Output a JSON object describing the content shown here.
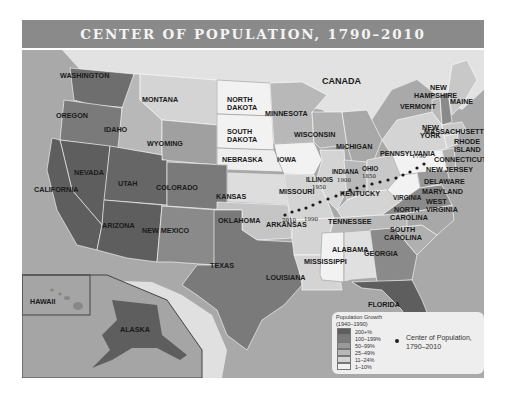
{
  "title": "CENTER OF POPULATION, 1790–2010",
  "labels": {
    "canada": "CANADA",
    "washington": "WASHINGTON",
    "oregon": "OREGON",
    "idaho": "IDAHO",
    "montana": "MONTANA",
    "wyoming": "WYOMING",
    "north_dakota_1": "NORTH",
    "north_dakota_2": "DAKOTA",
    "south_dakota_1": "SOUTH",
    "south_dakota_2": "DAKOTA",
    "minnesota": "MINNESOTA",
    "wisconsin": "WISCONSIN",
    "michigan": "MICHIGAN",
    "iowa": "IOWA",
    "nebraska": "NEBRASKA",
    "nevada": "NEVADA",
    "utah": "UTAH",
    "california": "CALIFORNIA",
    "colorado": "COLORADO",
    "kansas": "KANSAS",
    "missouri": "MISSOURI",
    "illinois": "ILLINOIS",
    "indiana": "INDIANA",
    "ohio": "OHIO",
    "pennsylvania": "PENNSYLVANIA",
    "new_york_1": "NEW",
    "new_york_2": "YORK",
    "vermont": "VERMONT",
    "new_hampshire_1": "NEW",
    "new_hampshire_2": "HAMPSHIRE",
    "maine": "MAINE",
    "massachusetts": "MASSACHUSETTS",
    "rhode_island_1": "RHODE",
    "rhode_island_2": "ISLAND",
    "connecticut": "CONNECTICUT",
    "new_jersey": "NEW JERSEY",
    "delaware": "DELAWARE",
    "maryland": "MARYLAND",
    "west_virginia_1": "WEST",
    "west_virginia_2": "VIRGINIA",
    "virginia": "VIRGINIA",
    "kentucky": "KENTUCKY",
    "tennessee": "TENNESSEE",
    "north_carolina_1": "NORTH",
    "north_carolina_2": "CAROLINA",
    "south_carolina_1": "SOUTH",
    "south_carolina_2": "CAROLINA",
    "georgia": "GEORGIA",
    "alabama": "ALABAMA",
    "mississippi": "MISSISSIPPI",
    "louisiana": "LOUISIANA",
    "arkansas": "ARKANSAS",
    "oklahoma": "OKLAHOMA",
    "texas": "TEXAS",
    "new_mexico": "NEW MEXICO",
    "arizona": "ARIZONA",
    "florida": "FLORIDA",
    "hawaii": "HAWAII",
    "alaska": "ALASKA"
  },
  "years": {
    "y1790": "1790",
    "y1850": "1850",
    "y1900": "1900",
    "y1950": "1950",
    "y1990": "1990",
    "y2010": "2010"
  },
  "legend": {
    "title_line1": "Population Growth",
    "title_line2": "(1940–1990)",
    "categories": [
      {
        "label": "200+%",
        "color": "#5e5e5e"
      },
      {
        "label": "100–199%",
        "color": "#7a7a7a"
      },
      {
        "label": "50–99%",
        "color": "#999999"
      },
      {
        "label": "25–49%",
        "color": "#b8b8b8"
      },
      {
        "label": "11–24%",
        "color": "#d4d4d4"
      },
      {
        "label": "1–10%",
        "color": "#f2f2f2"
      }
    ],
    "center_label_line1": "Center of Population,",
    "center_label_line2": "1790–2010"
  },
  "colors": {
    "title_bar": "#8a8a8a",
    "ocean": "#a9a9a9",
    "land_foreign": "#e2e2e2"
  }
}
